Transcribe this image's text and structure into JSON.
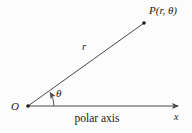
{
  "diagram": {
    "type": "polar-coordinates-figure",
    "labels": {
      "point": "P(r, θ)",
      "radius": "r",
      "angle": "θ",
      "origin": "O",
      "axis_caption": "polar axis",
      "axis_end": "x"
    },
    "colors": {
      "line": "#4a4a4a",
      "dot": "#1a1a1a",
      "text": "#1a1a1a",
      "background": "#fcfcfc"
    },
    "geometry": {
      "origin_px": [
        28,
        106
      ],
      "point_px": [
        144,
        23
      ],
      "axis_end_px": [
        181,
        106
      ],
      "angle_deg": 35.6,
      "arc_radius_px": 26
    }
  }
}
